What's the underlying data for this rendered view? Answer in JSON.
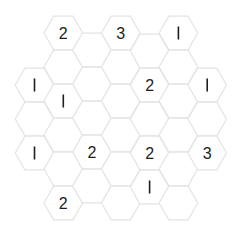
{
  "puzzle": {
    "type": "hexagonal-number-grid",
    "hex_radius": 19.3,
    "hex_half_height": 16.8,
    "stroke_color": "#e4e4e4",
    "fill_color": "#ffffff",
    "text_color": "#1e1e1e",
    "columns": [
      {
        "x": 34.5,
        "cells": [
          {
            "y": 85,
            "value": "1"
          },
          {
            "y": 119,
            "value": ""
          },
          {
            "y": 153,
            "value": "1"
          }
        ]
      },
      {
        "x": 63.3,
        "cells": [
          {
            "y": 33,
            "value": "2"
          },
          {
            "y": 67,
            "value": ""
          },
          {
            "y": 101,
            "value": "1"
          },
          {
            "y": 135,
            "value": ""
          },
          {
            "y": 169,
            "value": ""
          },
          {
            "y": 203,
            "value": "2"
          }
        ]
      },
      {
        "x": 92.0,
        "cells": [
          {
            "y": 50,
            "value": ""
          },
          {
            "y": 84,
            "value": ""
          },
          {
            "y": 118,
            "value": ""
          },
          {
            "y": 152,
            "value": "2"
          },
          {
            "y": 186,
            "value": ""
          }
        ]
      },
      {
        "x": 120.8,
        "cells": [
          {
            "y": 33,
            "value": "3"
          },
          {
            "y": 67,
            "value": ""
          },
          {
            "y": 101,
            "value": ""
          },
          {
            "y": 135,
            "value": ""
          },
          {
            "y": 169,
            "value": ""
          },
          {
            "y": 203,
            "value": ""
          }
        ]
      },
      {
        "x": 149.6,
        "cells": [
          {
            "y": 51,
            "value": ""
          },
          {
            "y": 85,
            "value": "2"
          },
          {
            "y": 119,
            "value": ""
          },
          {
            "y": 153,
            "value": "2"
          },
          {
            "y": 187,
            "value": "1"
          }
        ]
      },
      {
        "x": 178.4,
        "cells": [
          {
            "y": 33,
            "value": "1"
          },
          {
            "y": 67,
            "value": ""
          },
          {
            "y": 101,
            "value": ""
          },
          {
            "y": 135,
            "value": ""
          },
          {
            "y": 169,
            "value": ""
          },
          {
            "y": 203,
            "value": ""
          }
        ]
      },
      {
        "x": 207.2,
        "cells": [
          {
            "y": 85,
            "value": "1"
          },
          {
            "y": 119,
            "value": ""
          },
          {
            "y": 153,
            "value": "3"
          }
        ]
      }
    ]
  }
}
